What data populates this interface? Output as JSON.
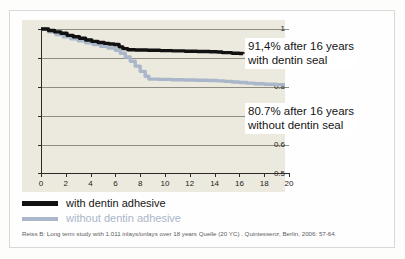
{
  "figure": {
    "background_color": "#fdfdfc",
    "panel_color": "#eceade",
    "frame_color": "#d8d8d4"
  },
  "chart_data": {
    "type": "line",
    "title": "",
    "subtitle": "",
    "xlabel": "",
    "ylabel": "",
    "xlim": [
      0,
      20
    ],
    "ylim": [
      0.5,
      1.0
    ],
    "grid": true,
    "grid_axis": "y",
    "legend_position": "below-plot",
    "xticks": [
      0,
      2,
      4,
      6,
      8,
      10,
      12,
      14,
      16,
      18,
      20
    ],
    "xtick_labels": [
      "0",
      "2",
      "4",
      "6",
      "8",
      "10",
      "12",
      "14",
      "16",
      "18",
      "20"
    ],
    "yticks": [
      0.5,
      0.6,
      0.7,
      0.8,
      0.9,
      1
    ],
    "ytick_labels": [
      "0.5",
      "0.6",
      "0.7",
      "0.8",
      "0.9",
      "1"
    ],
    "series": [
      {
        "name": "with dentin adhesive",
        "color": "#111111",
        "style": "step",
        "x": [
          0,
          0.6,
          1.1,
          1.6,
          2.1,
          2.6,
          3.1,
          3.6,
          4.1,
          4.6,
          5.1,
          5.5,
          5.9,
          6.3,
          6.6,
          7.0,
          7.6,
          8.6,
          9.6,
          10.6,
          11.6,
          12.6,
          13.6,
          14.2,
          14.6,
          15.4,
          16.0,
          16.3
        ],
        "y": [
          1.0,
          0.995,
          0.99,
          0.985,
          0.978,
          0.973,
          0.968,
          0.962,
          0.957,
          0.953,
          0.95,
          0.948,
          0.946,
          0.938,
          0.932,
          0.928,
          0.927,
          0.926,
          0.925,
          0.924,
          0.923,
          0.922,
          0.921,
          0.92,
          0.918,
          0.916,
          0.915,
          0.914
        ]
      },
      {
        "name": "without dentin adhesive",
        "color": "#aab6c9",
        "style": "step",
        "x": [
          0,
          0.6,
          1.2,
          1.8,
          2.4,
          3.0,
          3.6,
          4.2,
          4.8,
          5.4,
          6.0,
          6.4,
          6.8,
          7.2,
          7.6,
          8.0,
          8.4,
          8.7,
          9.5,
          10.5,
          11.5,
          12.5,
          13.5,
          14.2,
          14.8,
          15.4,
          16.0,
          16.6,
          17.2,
          18.0,
          19.0,
          20.0
        ],
        "y": [
          1.0,
          0.99,
          0.981,
          0.973,
          0.966,
          0.959,
          0.952,
          0.946,
          0.94,
          0.934,
          0.926,
          0.916,
          0.903,
          0.888,
          0.871,
          0.853,
          0.836,
          0.826,
          0.825,
          0.824,
          0.823,
          0.822,
          0.821,
          0.82,
          0.818,
          0.816,
          0.814,
          0.812,
          0.81,
          0.808,
          0.807,
          0.807
        ]
      }
    ],
    "annotations": [
      {
        "id": "with-dentin-seal",
        "line1": "91,4% after 16 years",
        "line2": "with dentin seal",
        "value": 0.914,
        "at_years": 16
      },
      {
        "id": "without-dentin-seal",
        "line1": "80.7% after 16 years",
        "line2": "without dentin seal",
        "value": 0.807,
        "at_years": 16
      }
    ]
  },
  "legend": {
    "items": [
      {
        "label": "with dentin adhesive",
        "color": "#111111"
      },
      {
        "label": "without dentin adhesive",
        "color": "#aab6c9"
      }
    ]
  },
  "citation": {
    "text": "Reiss B: Long term study with 1.011 inlays/onlays over 18 years Quelle  (20 YC) .  Quintessenz, Berlin, 2006: 57-64."
  }
}
